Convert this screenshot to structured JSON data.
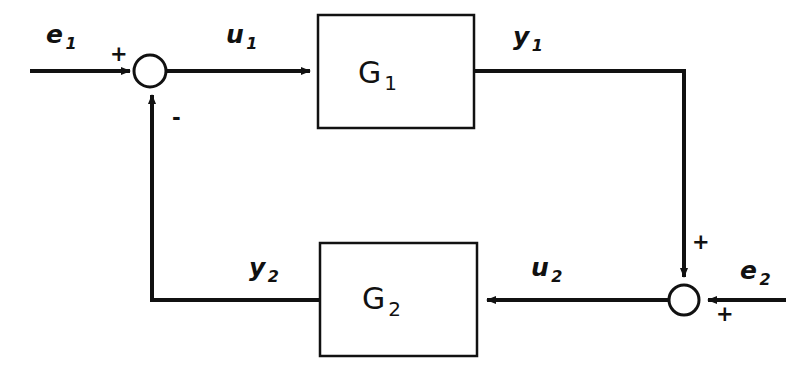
{
  "figure": {
    "kind": "block-diagram",
    "background_color": "#ffffff",
    "line_color": "#111111"
  },
  "blocks": [
    {
      "id": "G1",
      "label": "G",
      "subscript": "1",
      "x": 318,
      "y": 15,
      "width": 156,
      "height": 113
    },
    {
      "id": "G2",
      "label": "G",
      "subscript": "2",
      "x": 320,
      "y": 243,
      "width": 157,
      "height": 113
    }
  ],
  "summing_junctions": [
    {
      "id": "sum1",
      "cx": 150,
      "cy": 71,
      "r": 16
    },
    {
      "id": "sum2",
      "cx": 684,
      "cy": 300,
      "r": 15
    }
  ],
  "signals": [
    {
      "id": "e1",
      "label": "e",
      "subscript": "1",
      "x": 46,
      "y": 22
    },
    {
      "id": "u1",
      "label": "u",
      "subscript": "1",
      "x": 226,
      "y": 22
    },
    {
      "id": "y1",
      "label": "y",
      "subscript": "1",
      "x": 513,
      "y": 24
    },
    {
      "id": "e2",
      "label": "e",
      "subscript": "2",
      "x": 740,
      "y": 258
    },
    {
      "id": "u2",
      "label": "u",
      "subscript": "2",
      "x": 531,
      "y": 255
    },
    {
      "id": "y2",
      "label": "y",
      "subscript": "2",
      "x": 249,
      "y": 255
    }
  ],
  "signs": [
    {
      "id": "sum1-plus",
      "symbol": "+",
      "x": 110,
      "y": 44
    },
    {
      "id": "sum1-minus",
      "symbol": "-",
      "x": 172,
      "y": 108
    },
    {
      "id": "sum2-plus-top",
      "symbol": "+",
      "x": 692,
      "y": 232
    },
    {
      "id": "sum2-plus-right",
      "symbol": "+",
      "x": 716,
      "y": 304
    }
  ]
}
